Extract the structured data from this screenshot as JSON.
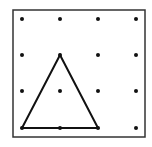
{
  "diagram": {
    "type": "geoboard",
    "grid": {
      "columns": 4,
      "rows": 4
    },
    "frame": {
      "x": 13,
      "y": 10,
      "width": 132,
      "height": 127,
      "stroke": "#333333"
    },
    "dot_x": [
      22,
      60,
      98,
      136
    ],
    "dot_y": [
      19,
      55,
      91,
      128
    ],
    "dot_color": "#111111",
    "shape": {
      "name": "triangle",
      "vertices_grid": [
        [
          1,
          1
        ],
        [
          0,
          3
        ],
        [
          2,
          3
        ]
      ],
      "stroke": "#111111"
    }
  }
}
